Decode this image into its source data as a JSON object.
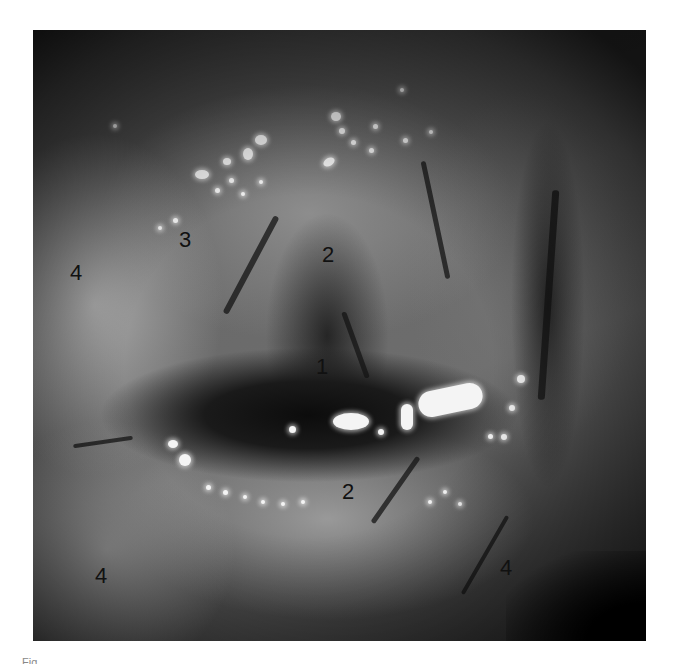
{
  "figure": {
    "type": "grayscale clinical photograph",
    "labels": [
      {
        "id": "label-1",
        "text": "1",
        "x": 316,
        "y": 356
      },
      {
        "id": "label-2-upper",
        "text": "2",
        "x": 322,
        "y": 244
      },
      {
        "id": "label-2-lower",
        "text": "2",
        "x": 342,
        "y": 481
      },
      {
        "id": "label-3",
        "text": "3",
        "x": 179,
        "y": 229
      },
      {
        "id": "label-4-upper-left",
        "text": "4",
        "x": 70,
        "y": 262
      },
      {
        "id": "label-4-lower-left",
        "text": "4",
        "x": 95,
        "y": 565
      },
      {
        "id": "label-4-lower-right",
        "text": "4",
        "x": 500,
        "y": 557
      }
    ],
    "colors": {
      "background": "#ffffff",
      "label_text": "#111111",
      "highlight": "#f4f4f4"
    }
  },
  "caption": {
    "text": "Fig."
  }
}
